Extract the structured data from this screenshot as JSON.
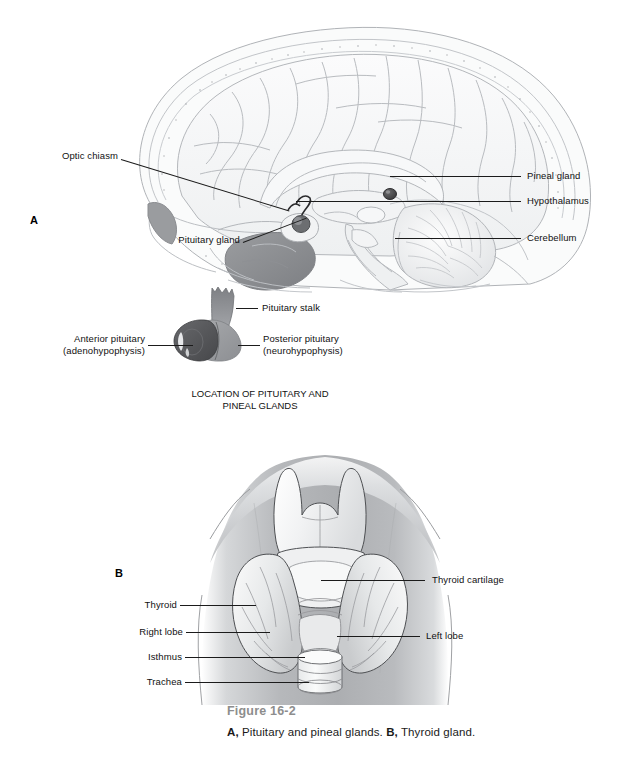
{
  "figure": {
    "number": "Figure 16-2",
    "caption_a_marker": "A,",
    "caption_a_text": " Pituitary and pineal glands. ",
    "caption_b_marker": "B,",
    "caption_b_text": " Thyroid gland."
  },
  "panel_a": {
    "letter": "A",
    "section_title_line1": "LOCATION OF PITUITARY AND",
    "section_title_line2": "PINEAL GLANDS",
    "labels": {
      "optic_chiasm": "Optic chiasm",
      "pituitary_gland": "Pituitary gland",
      "pineal_gland": "Pineal gland",
      "hypothalamus": "Hypothalamus",
      "cerebellum": "Cerebellum"
    },
    "inset_labels": {
      "pituitary_stalk": "Pituitary stalk",
      "anterior_pituitary_line1": "Anterior pituitary",
      "anterior_pituitary_line2": "(adenohypophysis)",
      "posterior_pituitary_line1": "Posterior pituitary",
      "posterior_pituitary_line2": "(neurohypophysis)"
    }
  },
  "panel_b": {
    "letter": "B",
    "labels": {
      "thyroid_cartilage": "Thyroid cartilage",
      "thyroid": "Thyroid",
      "right_lobe": "Right lobe",
      "left_lobe": "Left lobe",
      "isthmus": "Isthmus",
      "trachea": "Trachea"
    }
  },
  "colors": {
    "line_art": "#b9bcc0",
    "brain_fill": "#f4f5f6",
    "skull_fill": "#e9eaec",
    "pineal_dark": "#4a4a4a",
    "sinus_dark": "#8b8d90",
    "anterior_pituitary": "#555759",
    "posterior_pituitary": "#9a9c9f",
    "neck_gray": "#b4b6b9",
    "thyroid_fill": "#eceeef",
    "leader_line": "#1b1b1b",
    "figure_number_gray": "#8d8d8d"
  }
}
